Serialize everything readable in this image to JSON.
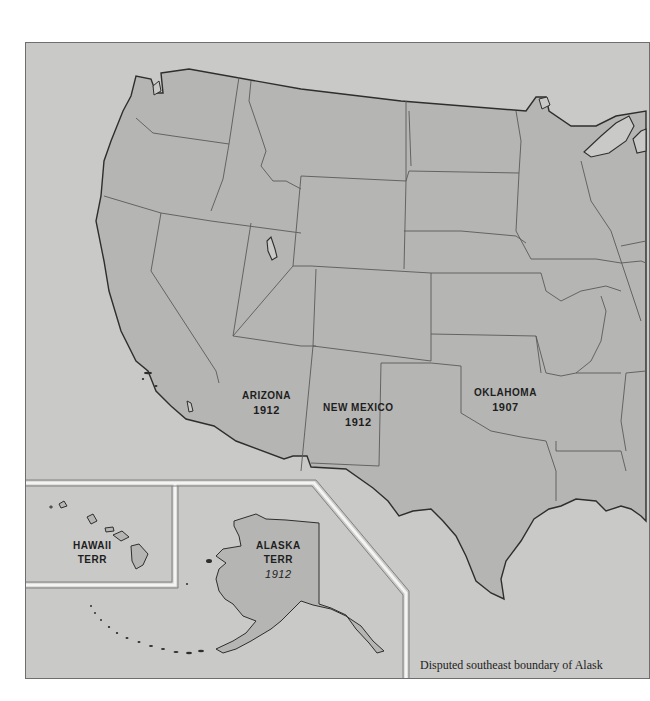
{
  "map": {
    "title": "",
    "colors": {
      "page_background": "#ffffff",
      "sea": "#c9c9c7",
      "land": "#b5b5b3",
      "border_line": "#5a5a5a",
      "coast_line": "#2e2e2e",
      "inset_frame": "#f4f4f4",
      "label_text": "#1e1e1e"
    },
    "labels": {
      "arizona": {
        "name": "ARIZONA",
        "year": "1912"
      },
      "new_mexico": {
        "name": "NEW MEXICO",
        "year": "1912"
      },
      "oklahoma": {
        "name": "OKLAHOMA",
        "year": "1907"
      },
      "hawaii": {
        "name": "HAWAII",
        "status": "TERR"
      },
      "alaska": {
        "name": "ALASKA",
        "status": "TERR",
        "year": "1912"
      }
    },
    "insets": [
      "Hawaii Territory",
      "Alaska Territory"
    ],
    "caption": "Disputed southeast boundary of Alask"
  }
}
